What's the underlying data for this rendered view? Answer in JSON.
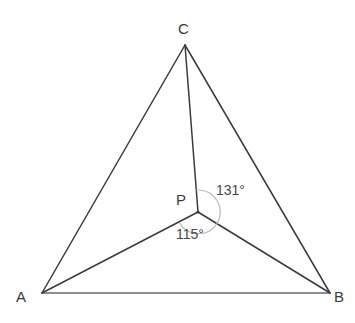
{
  "figure": {
    "kind": "geometry-diagram",
    "width": 355,
    "height": 323,
    "background_color": "#ffffff",
    "line_color": "#3b3b3b",
    "base_line_color": "#6b6b6b",
    "arc_color": "#b9b9b9",
    "label_color": "#3a3a3a",
    "angle_label_color": "#474747"
  },
  "points": {
    "A": {
      "label": "A",
      "x": 42,
      "y": 293
    },
    "B": {
      "label": "B",
      "x": 330,
      "y": 293
    },
    "C": {
      "label": "C",
      "x": 185,
      "y": 45
    },
    "P": {
      "label": "P",
      "x": 198,
      "y": 212
    }
  },
  "segments": [
    {
      "name": "side-AC",
      "from": "A",
      "to": "C"
    },
    {
      "name": "side-BC",
      "from": "B",
      "to": "C"
    },
    {
      "name": "side-AB",
      "from": "A",
      "to": "B"
    },
    {
      "name": "cevian-PA",
      "from": "P",
      "to": "A"
    },
    {
      "name": "cevian-PB",
      "from": "P",
      "to": "B"
    },
    {
      "name": "cevian-PC",
      "from": "P",
      "to": "C"
    }
  ],
  "angles": [
    {
      "name": "angle-CPB",
      "value": "131°",
      "number": 131,
      "at": "P",
      "between": [
        "C",
        "B"
      ],
      "arc_radius": 22
    },
    {
      "name": "angle-APB",
      "value": "115°",
      "number": 115,
      "at": "P",
      "between": [
        "A",
        "B"
      ],
      "arc_radius": 22
    }
  ]
}
